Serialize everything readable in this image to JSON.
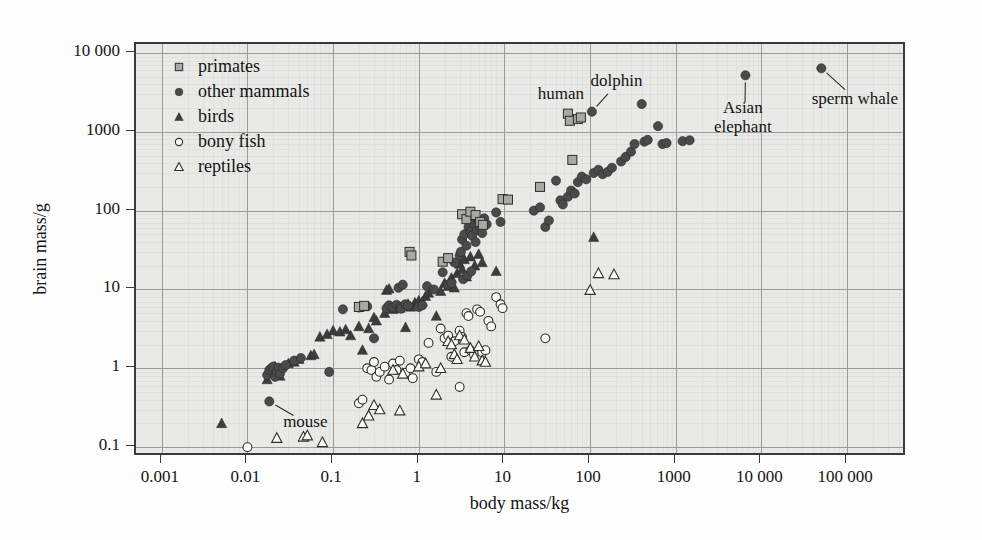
{
  "figure": {
    "background_color": "#fdfdfd",
    "plot_background_color": "#e9e9e7",
    "frame_color": "#3a3a3a",
    "gridline_color": "#9a9a9a"
  },
  "chart_data": {
    "type": "scatter",
    "title": "",
    "xlabel": "body mass/kg",
    "ylabel": "brain mass/g",
    "xscale": "log",
    "yscale": "log",
    "xlim": [
      0.0005,
      500000
    ],
    "ylim": [
      0.075,
      13000
    ],
    "grid": true,
    "legend_position": "upper-left-inside",
    "xticks": [
      0.001,
      0.01,
      0.1,
      1,
      10,
      100,
      1000,
      10000,
      100000
    ],
    "xtick_labels": [
      "0.001",
      "0.01",
      "0.1",
      "1",
      "10",
      "100",
      "1000",
      "10 000",
      "100 000"
    ],
    "yticks": [
      0.1,
      1,
      10,
      100,
      1000,
      10000
    ],
    "ytick_labels": [
      "0.1",
      "1",
      "10",
      "100",
      "1000",
      "10 000"
    ],
    "series": [
      {
        "name": "primates",
        "marker": "filled-square",
        "color": "#a8a8a4",
        "edge_color": "#2e2e2e",
        "points": [
          [
            0.2,
            6.0
          ],
          [
            0.23,
            6.2
          ],
          [
            0.78,
            30.0
          ],
          [
            0.82,
            27.0
          ],
          [
            1.9,
            22.5
          ],
          [
            2.2,
            25.0
          ],
          [
            3.2,
            90.0
          ],
          [
            3.6,
            78.0
          ],
          [
            4.0,
            97.0
          ],
          [
            4.6,
            88.0
          ],
          [
            5.2,
            72.0
          ],
          [
            5.6,
            66.0
          ],
          [
            9.5,
            140.0
          ],
          [
            11.0,
            138.0
          ],
          [
            26.0,
            200.0
          ],
          [
            62.0,
            440.0
          ],
          [
            55.0,
            1700.0
          ],
          [
            58.0,
            1380.0
          ],
          [
            72.0,
            1450.0
          ],
          [
            78.0,
            1520.0
          ]
        ]
      },
      {
        "name": "other mammals",
        "marker": "filled-circle",
        "color": "#4a4a4a",
        "edge_color": "#2a2a2a",
        "points": [
          [
            0.018,
            0.38
          ],
          [
            0.017,
            0.82
          ],
          [
            0.018,
            0.95
          ],
          [
            0.019,
            1.0
          ],
          [
            0.02,
            1.05
          ],
          [
            0.021,
            0.78
          ],
          [
            0.022,
            0.9
          ],
          [
            0.023,
            1.02
          ],
          [
            0.024,
            0.86
          ],
          [
            0.026,
            1.0
          ],
          [
            0.028,
            1.1
          ],
          [
            0.035,
            1.25
          ],
          [
            0.042,
            1.35
          ],
          [
            0.09,
            0.9
          ],
          [
            0.13,
            5.6
          ],
          [
            0.2,
            5.9
          ],
          [
            0.22,
            6.0
          ],
          [
            0.25,
            6.1
          ],
          [
            0.3,
            2.4
          ],
          [
            0.42,
            5.8
          ],
          [
            0.45,
            6.3
          ],
          [
            0.5,
            5.9
          ],
          [
            0.55,
            6.4
          ],
          [
            0.6,
            6.0
          ],
          [
            0.62,
            5.7
          ],
          [
            0.7,
            6.5
          ],
          [
            0.75,
            6.2
          ],
          [
            0.58,
            10.5
          ],
          [
            0.65,
            11.5
          ],
          [
            1.0,
            6.0
          ],
          [
            1.1,
            6.3
          ],
          [
            1.25,
            11.0
          ],
          [
            1.5,
            10.0
          ],
          [
            1.9,
            16.5
          ],
          [
            2.2,
            11.5
          ],
          [
            2.4,
            12.0
          ],
          [
            2.6,
            22.0
          ],
          [
            3.0,
            27.0
          ],
          [
            3.1,
            30.0
          ],
          [
            3.2,
            43.0
          ],
          [
            3.4,
            50.0
          ],
          [
            3.6,
            36.0
          ],
          [
            3.8,
            62.0
          ],
          [
            4.0,
            55.0
          ],
          [
            4.2,
            48.0
          ],
          [
            4.4,
            68.0
          ],
          [
            4.6,
            40.0
          ],
          [
            4.8,
            57.0
          ],
          [
            5.0,
            74.0
          ],
          [
            5.2,
            60.0
          ],
          [
            5.5,
            52.0
          ],
          [
            5.8,
            80.0
          ],
          [
            6.2,
            67.0
          ],
          [
            3.3,
            13.5
          ],
          [
            3.7,
            15.0
          ],
          [
            4.1,
            17.0
          ],
          [
            8.0,
            95.0
          ],
          [
            9.0,
            72.0
          ],
          [
            22.0,
            100.0
          ],
          [
            26.0,
            110.0
          ],
          [
            30.0,
            62.0
          ],
          [
            33.0,
            75.0
          ],
          [
            40.0,
            240.0
          ],
          [
            45.0,
            135.0
          ],
          [
            48.0,
            120.0
          ],
          [
            55.0,
            150.0
          ],
          [
            60.0,
            180.0
          ],
          [
            66.0,
            165.0
          ],
          [
            72.0,
            230.0
          ],
          [
            80.0,
            270.0
          ],
          [
            90.0,
            250.0
          ],
          [
            105.0,
            1800.0
          ],
          [
            110.0,
            300.0
          ],
          [
            125.0,
            330.0
          ],
          [
            140.0,
            290.0
          ],
          [
            160.0,
            310.0
          ],
          [
            180.0,
            350.0
          ],
          [
            230.0,
            420.0
          ],
          [
            260.0,
            480.0
          ],
          [
            300.0,
            560.0
          ],
          [
            330.0,
            700.0
          ],
          [
            400.0,
            2250.0
          ],
          [
            430.0,
            750.0
          ],
          [
            470.0,
            790.0
          ],
          [
            620.0,
            1180.0
          ],
          [
            700.0,
            700.0
          ],
          [
            780.0,
            720.0
          ],
          [
            1200.0,
            760.0
          ],
          [
            1450.0,
            780.0
          ],
          [
            6500.0,
            5200.0
          ],
          [
            50000.0,
            6400.0
          ]
        ]
      },
      {
        "name": "birds",
        "marker": "filled-triangle",
        "color": "#3c3c3c",
        "edge_color": "#2a2a2a",
        "points": [
          [
            0.005,
            0.2
          ],
          [
            0.017,
            0.72
          ],
          [
            0.019,
            0.88
          ],
          [
            0.02,
            1.0
          ],
          [
            0.021,
            1.05
          ],
          [
            0.022,
            0.95
          ],
          [
            0.024,
            0.8
          ],
          [
            0.03,
            1.15
          ],
          [
            0.035,
            1.2
          ],
          [
            0.04,
            1.3
          ],
          [
            0.055,
            1.45
          ],
          [
            0.06,
            1.5
          ],
          [
            0.07,
            2.5
          ],
          [
            0.085,
            2.7
          ],
          [
            0.1,
            3.0
          ],
          [
            0.12,
            2.9
          ],
          [
            0.14,
            3.1
          ],
          [
            0.16,
            2.6
          ],
          [
            0.2,
            3.4
          ],
          [
            0.22,
            1.7
          ],
          [
            0.26,
            3.2
          ],
          [
            0.3,
            4.4
          ],
          [
            0.32,
            4.0
          ],
          [
            0.4,
            5.0
          ],
          [
            0.42,
            9.8
          ],
          [
            0.45,
            10.2
          ],
          [
            0.5,
            5.6
          ],
          [
            0.55,
            6.0
          ],
          [
            0.6,
            5.8
          ],
          [
            0.65,
            6.2
          ],
          [
            0.7,
            3.3
          ],
          [
            0.75,
            6.5
          ],
          [
            0.8,
            6.0
          ],
          [
            0.9,
            6.8
          ],
          [
            1.0,
            7.2
          ],
          [
            1.1,
            7.0
          ],
          [
            1.2,
            8.2
          ],
          [
            1.3,
            9.0
          ],
          [
            1.6,
            4.6
          ],
          [
            1.8,
            9.5
          ],
          [
            2.0,
            12.0
          ],
          [
            2.2,
            11.0
          ],
          [
            2.4,
            14.0
          ],
          [
            2.6,
            10.5
          ],
          [
            2.8,
            16.0
          ],
          [
            3.0,
            21.0
          ],
          [
            3.2,
            18.0
          ],
          [
            3.4,
            24.0
          ],
          [
            3.6,
            14.5
          ],
          [
            4.0,
            26.0
          ],
          [
            4.5,
            20.0
          ],
          [
            5.0,
            28.0
          ],
          [
            5.5,
            22.0
          ],
          [
            8.0,
            17.0
          ],
          [
            110.0,
            46.0
          ]
        ]
      },
      {
        "name": "bony fish",
        "marker": "open-circle",
        "color": "#fafaf8",
        "edge_color": "#2e2e2e",
        "points": [
          [
            0.01,
            0.1
          ],
          [
            0.2,
            0.36
          ],
          [
            0.22,
            0.4
          ],
          [
            0.25,
            1.0
          ],
          [
            0.28,
            0.95
          ],
          [
            0.3,
            1.2
          ],
          [
            0.32,
            0.78
          ],
          [
            0.35,
            0.9
          ],
          [
            0.4,
            1.05
          ],
          [
            0.45,
            0.72
          ],
          [
            0.5,
            1.15
          ],
          [
            0.55,
            0.95
          ],
          [
            0.6,
            1.25
          ],
          [
            0.7,
            0.88
          ],
          [
            0.8,
            1.0
          ],
          [
            0.85,
            0.75
          ],
          [
            1.0,
            1.3
          ],
          [
            1.1,
            1.2
          ],
          [
            1.3,
            2.1
          ],
          [
            1.6,
            0.9
          ],
          [
            1.8,
            3.2
          ],
          [
            2.0,
            2.4
          ],
          [
            2.2,
            2.6
          ],
          [
            2.4,
            1.4
          ],
          [
            2.6,
            2.2
          ],
          [
            3.0,
            3.0
          ],
          [
            3.2,
            2.5
          ],
          [
            3.4,
            1.6
          ],
          [
            3.0,
            0.58
          ],
          [
            3.6,
            5.0
          ],
          [
            3.8,
            4.6
          ],
          [
            4.0,
            1.7
          ],
          [
            4.4,
            1.5
          ],
          [
            4.8,
            5.6
          ],
          [
            5.2,
            5.2
          ],
          [
            5.5,
            1.6
          ],
          [
            6.0,
            1.7
          ],
          [
            6.5,
            4.0
          ],
          [
            7.0,
            3.4
          ],
          [
            8.0,
            8.0
          ],
          [
            9.0,
            6.5
          ],
          [
            9.5,
            5.8
          ],
          [
            30.0,
            2.4
          ]
        ]
      },
      {
        "name": "reptiles",
        "marker": "open-triangle",
        "color": "#fafaf8",
        "edge_color": "#2e2e2e",
        "points": [
          [
            0.022,
            0.13
          ],
          [
            0.045,
            0.135
          ],
          [
            0.05,
            0.14
          ],
          [
            0.075,
            0.115
          ],
          [
            0.22,
            0.2
          ],
          [
            0.26,
            0.25
          ],
          [
            0.3,
            0.34
          ],
          [
            0.35,
            0.3
          ],
          [
            0.6,
            0.29
          ],
          [
            0.5,
            0.95
          ],
          [
            0.65,
            0.85
          ],
          [
            1.0,
            1.05
          ],
          [
            1.2,
            1.15
          ],
          [
            1.6,
            0.46
          ],
          [
            1.8,
            1.0
          ],
          [
            2.2,
            2.2
          ],
          [
            2.4,
            2.0
          ],
          [
            2.6,
            1.5
          ],
          [
            2.8,
            1.3
          ],
          [
            3.0,
            2.6
          ],
          [
            3.4,
            2.3
          ],
          [
            4.0,
            1.8
          ],
          [
            4.5,
            1.4
          ],
          [
            5.0,
            1.9
          ],
          [
            5.5,
            1.25
          ],
          [
            6.0,
            1.2
          ],
          [
            100.0,
            9.8
          ],
          [
            125.0,
            16.0
          ],
          [
            190.0,
            15.5
          ]
        ]
      }
    ],
    "annotations": [
      {
        "label": "human",
        "x": 55,
        "y": 1700,
        "text_x": 48,
        "text_y": 2900,
        "leader": false
      },
      {
        "label": "dolphin",
        "x": 105,
        "y": 1800,
        "text_x": 215,
        "text_y": 4300,
        "leader": true
      },
      {
        "label": "Asian\nelephant",
        "x": 6500,
        "y": 5200,
        "text_x": 6400,
        "text_y": 1500,
        "leader": true
      },
      {
        "label": "sperm whale",
        "x": 50000,
        "y": 6400,
        "text_x": 130000,
        "text_y": 2500,
        "leader": true
      },
      {
        "label": "mouse",
        "x": 0.018,
        "y": 0.38,
        "text_x": 0.05,
        "text_y": 0.2,
        "leader": true
      }
    ]
  },
  "legend": {
    "items": [
      {
        "label": "primates",
        "key": "primates",
        "marker": "filled-square"
      },
      {
        "label": "other mammals",
        "key": "other_mammals",
        "marker": "filled-circle"
      },
      {
        "label": "birds",
        "key": "birds",
        "marker": "filled-triangle"
      },
      {
        "label": "bony fish",
        "key": "bony_fish",
        "marker": "open-circle"
      },
      {
        "label": "reptiles",
        "key": "reptiles",
        "marker": "open-triangle"
      }
    ]
  }
}
